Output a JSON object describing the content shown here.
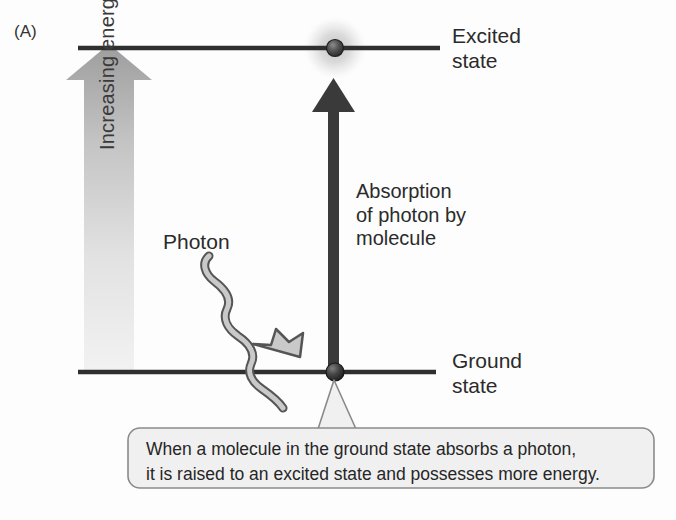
{
  "figure": {
    "panel_label": "(A)",
    "background_color": "#fdfdfd"
  },
  "levels": {
    "excited": {
      "label_line1": "Excited",
      "label_line2": "state",
      "line_color": "#2f2f2f",
      "sphere_color": "#4a4a4a",
      "glow_color": "#d9d9d9"
    },
    "ground": {
      "label_line1": "Ground",
      "label_line2": "state",
      "line_color": "#2f2f2f",
      "sphere_color": "#3d3d3d"
    }
  },
  "energy_arrow": {
    "label": "Increasing energy",
    "gradient_top_color": "#9a9a9a",
    "gradient_bottom_color": "#ededed"
  },
  "absorption_arrow": {
    "label_line1": "Absorption",
    "label_line2": "of photon by",
    "label_line3": "molecule",
    "color": "#3a3a3a"
  },
  "photon": {
    "label": "Photon",
    "fill_color": "#c9c9c9",
    "stroke_color": "#555555"
  },
  "caption": {
    "line1": "When a molecule in the ground state absorbs a photon,",
    "line2": "it is raised to an excited state and possesses more energy.",
    "box_fill": "#f0f0f0",
    "box_stroke": "#8a8a8a"
  }
}
